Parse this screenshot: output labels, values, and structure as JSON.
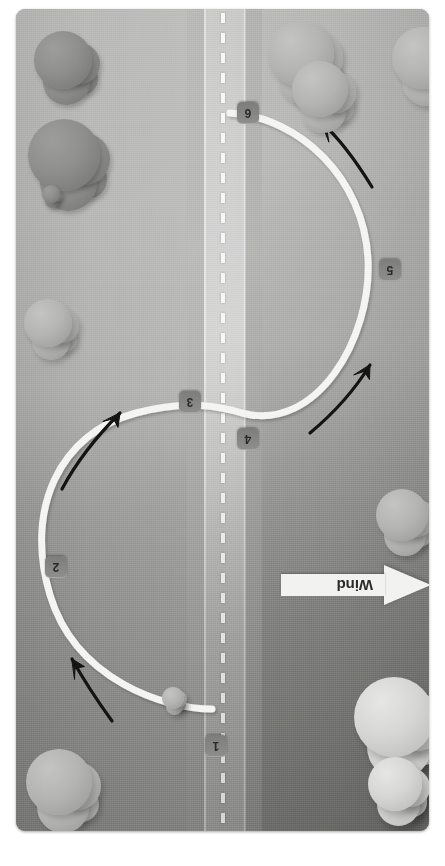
{
  "diagram": {
    "orientation_note": "image rotated 180 degrees",
    "background": {
      "scene": "aerial-view",
      "road_label": "road-with-dashed-centerline",
      "grass_color": "#b2b2b0",
      "road_color": "#d4d4d3",
      "centerline_color": "#f7f7f6"
    },
    "path": {
      "name": "flight-track",
      "shape": "s-curve",
      "color": "#f4f4f2",
      "width_px": 7
    },
    "waypoints": [
      {
        "id": "waypoint-1",
        "label": "1",
        "x": 205,
        "y": 735
      },
      {
        "id": "waypoint-2",
        "label": "2",
        "x": 45,
        "y": 556
      },
      {
        "id": "waypoint-3",
        "label": "3",
        "x": 179,
        "y": 391
      },
      {
        "id": "waypoint-4",
        "label": "4",
        "x": 237,
        "y": 428
      },
      {
        "id": "waypoint-5",
        "label": "5",
        "x": 379,
        "y": 259
      },
      {
        "id": "waypoint-6",
        "label": "6",
        "x": 237,
        "y": 102
      }
    ],
    "arrows": [
      {
        "id": "direction-arrow-1",
        "points_to": "waypoint-2",
        "description": "curved arrow pointing up-left, lower left quadrant"
      },
      {
        "id": "direction-arrow-2",
        "points_to": "waypoint-3",
        "description": "curved arrow pointing up-right, mid left"
      },
      {
        "id": "direction-arrow-3",
        "points_to": "waypoint-5",
        "description": "curved arrow pointing up-right, mid right"
      },
      {
        "id": "direction-arrow-4",
        "points_to": "waypoint-6",
        "description": "curved arrow pointing up-left, upper right"
      }
    ],
    "wind_indicator": {
      "label": "Wind",
      "direction": "arrow pointing left",
      "banner_color": "#f2f2f0",
      "text_color": "#2b2b29"
    },
    "trees": [
      {
        "id": "tree-1",
        "tone": "dark",
        "x": 18,
        "y": 22,
        "size": 58
      },
      {
        "id": "tree-2",
        "tone": "dark",
        "x": 12,
        "y": 110,
        "size": 72
      },
      {
        "id": "tree-3",
        "tone": "dark",
        "x": 26,
        "y": 176,
        "size": 18
      },
      {
        "id": "tree-4",
        "tone": "mid",
        "x": 8,
        "y": 290,
        "size": 48
      },
      {
        "id": "tree-5",
        "tone": "mid",
        "x": 252,
        "y": 12,
        "size": 66
      },
      {
        "id": "tree-6",
        "tone": "mid",
        "x": 276,
        "y": 52,
        "size": 56
      },
      {
        "id": "tree-7",
        "tone": "mid",
        "x": 376,
        "y": 18,
        "size": 62
      },
      {
        "id": "tree-8",
        "tone": "mid",
        "x": 360,
        "y": 480,
        "size": 52
      },
      {
        "id": "tree-9",
        "tone": "light",
        "x": 338,
        "y": 668,
        "size": 80
      },
      {
        "id": "tree-10",
        "tone": "light",
        "x": 352,
        "y": 748,
        "size": 54
      },
      {
        "id": "tree-11",
        "tone": "mid",
        "x": 10,
        "y": 740,
        "size": 66
      },
      {
        "id": "tree-12",
        "tone": "mid",
        "x": 146,
        "y": 678,
        "size": 22
      }
    ]
  }
}
